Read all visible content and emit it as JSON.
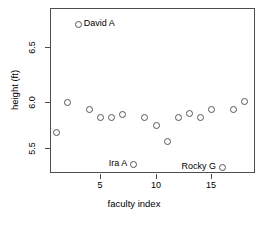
{
  "chart_data": {
    "type": "scatter",
    "title": "",
    "xlabel": "faculty index",
    "ylabel": "height (ft)",
    "xlim": [
      0.3,
      18.7
    ],
    "ylim": [
      5.26,
      6.92
    ],
    "grid": false,
    "legend": null,
    "xticks": [
      5,
      10,
      15
    ],
    "yticks": [
      5.5,
      6.0,
      6.5
    ],
    "xtick_labels": [
      "5",
      "10",
      "15"
    ],
    "ytick_labels": [
      "5.5",
      "6.0",
      "6.5"
    ],
    "marker": "open-circle",
    "x": [
      1,
      2,
      3,
      4,
      5,
      6,
      7,
      8,
      9,
      10,
      11,
      12,
      13,
      14,
      15,
      16,
      17,
      18
    ],
    "y": [
      5.67,
      6.0,
      6.85,
      5.92,
      5.84,
      5.84,
      5.87,
      5.33,
      5.84,
      5.75,
      5.58,
      5.84,
      5.88,
      5.84,
      5.92,
      5.29,
      5.92,
      6.01
    ],
    "points": [
      {
        "x": 1,
        "y": 5.67,
        "label": ""
      },
      {
        "x": 2,
        "y": 6.0,
        "label": ""
      },
      {
        "x": 3,
        "y": 6.85,
        "label": "David A"
      },
      {
        "x": 4,
        "y": 5.92,
        "label": ""
      },
      {
        "x": 5,
        "y": 5.84,
        "label": ""
      },
      {
        "x": 6,
        "y": 5.84,
        "label": ""
      },
      {
        "x": 7,
        "y": 5.87,
        "label": ""
      },
      {
        "x": 8,
        "y": 5.33,
        "label": "Ira A"
      },
      {
        "x": 9,
        "y": 5.84,
        "label": ""
      },
      {
        "x": 10,
        "y": 5.75,
        "label": ""
      },
      {
        "x": 11,
        "y": 5.58,
        "label": ""
      },
      {
        "x": 12,
        "y": 5.84,
        "label": ""
      },
      {
        "x": 13,
        "y": 5.88,
        "label": ""
      },
      {
        "x": 14,
        "y": 5.84,
        "label": ""
      },
      {
        "x": 15,
        "y": 5.92,
        "label": ""
      },
      {
        "x": 16,
        "y": 5.29,
        "label": "Rocky G"
      },
      {
        "x": 17,
        "y": 5.92,
        "label": ""
      },
      {
        "x": 18,
        "y": 6.01,
        "label": ""
      }
    ],
    "annotations": [
      {
        "text": "David A",
        "x": 3,
        "y": 6.85,
        "position": "right"
      },
      {
        "text": "Ira A",
        "x": 8,
        "y": 5.33,
        "position": "left"
      },
      {
        "text": "Rocky G",
        "x": 16,
        "y": 5.29,
        "position": "left"
      }
    ],
    "colors": {
      "marker_stroke": "#555555",
      "axis": "#4d4d4d",
      "text": "#000000",
      "background": "#ffffff"
    }
  }
}
